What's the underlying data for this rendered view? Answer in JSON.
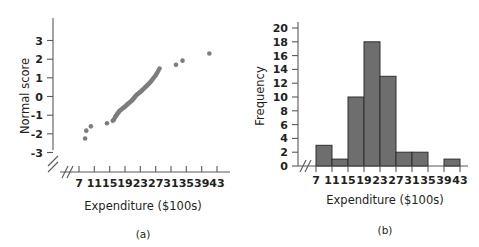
{
  "figure": {
    "panels": [
      {
        "id": "a",
        "caption": "(a)",
        "xlabel": "Expenditure ($100s)",
        "ylabel": "Normal score"
      },
      {
        "id": "b",
        "caption": "(b)",
        "xlabel": "Expenditure ($100s)",
        "ylabel": "Frequency"
      }
    ]
  },
  "colors": {
    "dot": "#7d7d7d",
    "bar_fill": "#6e6e6e",
    "bar_stroke": "#2f2f2f",
    "axis": "#58595b",
    "text": "#231f20",
    "background": "#ffffff"
  },
  "chart_data": [
    {
      "type": "scatter",
      "title": "",
      "panel": "(a)",
      "xlabel": "Expenditure ($100s)",
      "ylabel": "Normal score",
      "xlim": [
        5,
        45
      ],
      "ylim": [
        -3.5,
        3.5
      ],
      "xticks": [
        7,
        11,
        15,
        19,
        23,
        27,
        31,
        35,
        39,
        43
      ],
      "yticks": [
        -3,
        -2,
        -1,
        0,
        1,
        2,
        3
      ],
      "axis_break_x": true,
      "grid": false,
      "legend": "none",
      "points": [
        {
          "x": 8.6,
          "y": -2.25
        },
        {
          "x": 8.9,
          "y": -1.83
        },
        {
          "x": 10.1,
          "y": -1.6
        },
        {
          "x": 14.3,
          "y": -1.43
        },
        {
          "x": 15.8,
          "y": -1.3
        },
        {
          "x": 16.1,
          "y": -1.24
        },
        {
          "x": 16.4,
          "y": -1.12
        },
        {
          "x": 16.6,
          "y": -1.05
        },
        {
          "x": 16.8,
          "y": -0.99
        },
        {
          "x": 17.0,
          "y": -0.93
        },
        {
          "x": 17.2,
          "y": -0.88
        },
        {
          "x": 17.4,
          "y": -0.82
        },
        {
          "x": 17.6,
          "y": -0.77
        },
        {
          "x": 17.9,
          "y": -0.72
        },
        {
          "x": 18.2,
          "y": -0.67
        },
        {
          "x": 18.5,
          "y": -0.62
        },
        {
          "x": 18.8,
          "y": -0.57
        },
        {
          "x": 19.1,
          "y": -0.52
        },
        {
          "x": 19.4,
          "y": -0.47
        },
        {
          "x": 19.6,
          "y": -0.42
        },
        {
          "x": 19.9,
          "y": -0.37
        },
        {
          "x": 20.2,
          "y": -0.32
        },
        {
          "x": 20.5,
          "y": -0.27
        },
        {
          "x": 20.8,
          "y": -0.22
        },
        {
          "x": 21.0,
          "y": -0.17
        },
        {
          "x": 21.2,
          "y": -0.12
        },
        {
          "x": 21.4,
          "y": -0.07
        },
        {
          "x": 21.6,
          "y": -0.02
        },
        {
          "x": 21.8,
          "y": 0.03
        },
        {
          "x": 22.0,
          "y": 0.08
        },
        {
          "x": 22.3,
          "y": 0.13
        },
        {
          "x": 22.6,
          "y": 0.18
        },
        {
          "x": 22.9,
          "y": 0.23
        },
        {
          "x": 23.2,
          "y": 0.28
        },
        {
          "x": 23.5,
          "y": 0.34
        },
        {
          "x": 23.8,
          "y": 0.4
        },
        {
          "x": 24.1,
          "y": 0.46
        },
        {
          "x": 24.4,
          "y": 0.52
        },
        {
          "x": 24.7,
          "y": 0.58
        },
        {
          "x": 25.0,
          "y": 0.64
        },
        {
          "x": 25.3,
          "y": 0.7
        },
        {
          "x": 25.6,
          "y": 0.77
        },
        {
          "x": 25.9,
          "y": 0.84
        },
        {
          "x": 26.2,
          "y": 0.92
        },
        {
          "x": 26.5,
          "y": 1.0
        },
        {
          "x": 26.8,
          "y": 1.08
        },
        {
          "x": 27.1,
          "y": 1.17
        },
        {
          "x": 27.4,
          "y": 1.27
        },
        {
          "x": 27.7,
          "y": 1.38
        },
        {
          "x": 28.0,
          "y": 1.5
        },
        {
          "x": 32.3,
          "y": 1.7
        },
        {
          "x": 34.0,
          "y": 1.92
        },
        {
          "x": 41.0,
          "y": 2.3
        }
      ]
    },
    {
      "type": "bar",
      "panel": "(b)",
      "title": "",
      "xlabel": "Expenditure ($100s)",
      "ylabel": "Frequency",
      "xlim": [
        5,
        45
      ],
      "ylim": [
        0,
        21
      ],
      "xticks": [
        7,
        11,
        15,
        19,
        23,
        27,
        31,
        35,
        39,
        43
      ],
      "yticks": [
        0,
        2,
        4,
        6,
        8,
        10,
        12,
        14,
        16,
        18,
        20
      ],
      "axis_break_x": true,
      "grid": false,
      "legend": "none",
      "bin_edges": [
        7,
        11,
        15,
        19,
        23,
        27,
        31,
        35,
        39,
        43
      ],
      "categories": [
        "7-11",
        "11-15",
        "15-19",
        "19-23",
        "23-27",
        "27-31",
        "31-35",
        "35-39",
        "39-43"
      ],
      "values": [
        3,
        1,
        10,
        18,
        13,
        2,
        2,
        0,
        1
      ]
    }
  ]
}
